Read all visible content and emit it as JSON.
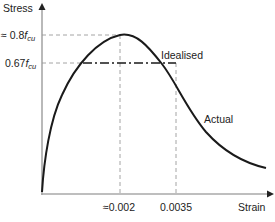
{
  "diagram": {
    "type": "stress-strain curve (concrete)",
    "axes": {
      "y_label": "Stress",
      "x_label": "Strain"
    },
    "y_ticks": [
      {
        "prefix": "≈ 0.8",
        "symbol": "f",
        "subscript": "cu"
      },
      {
        "prefix": "0.67",
        "symbol": "f",
        "subscript": "cu"
      }
    ],
    "x_ticks": [
      {
        "label": "≈0.002"
      },
      {
        "label": "0.0035"
      }
    ],
    "curves": [
      {
        "name": "Actual",
        "style": "solid"
      },
      {
        "name": "Idealised",
        "style": "dash-dot"
      }
    ],
    "colors": {
      "curve": "#1a1a1a",
      "axis": "#999999",
      "guides": "#9a9a9a",
      "text": "#222222"
    }
  }
}
